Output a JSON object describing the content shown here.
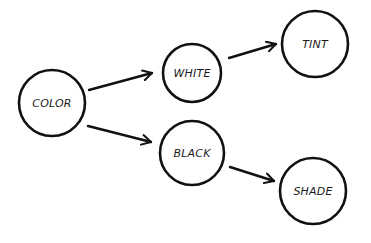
{
  "diagram": {
    "type": "concept-map",
    "colors": {
      "stroke": "#111111",
      "text": "#1a1a1a",
      "background": "#ffffff"
    },
    "nodes": [
      {
        "id": "color",
        "label": "COLOR",
        "cx": 52,
        "cy": 103,
        "r": 33
      },
      {
        "id": "white",
        "label": "WHITE",
        "cx": 192,
        "cy": 73,
        "r": 29
      },
      {
        "id": "tint",
        "label": "TINT",
        "cx": 315,
        "cy": 44,
        "r": 33
      },
      {
        "id": "black",
        "label": "BLACK",
        "cx": 192,
        "cy": 153,
        "r": 32
      },
      {
        "id": "shade",
        "label": "SHADE",
        "cx": 313,
        "cy": 191,
        "r": 33
      }
    ],
    "edges": [
      {
        "from": "color",
        "to": "white",
        "x1": 89,
        "y1": 90,
        "x2": 152,
        "y2": 73
      },
      {
        "from": "color",
        "to": "black",
        "x1": 88,
        "y1": 126,
        "x2": 151,
        "y2": 142
      },
      {
        "from": "white",
        "to": "tint",
        "x1": 229,
        "y1": 58,
        "x2": 276,
        "y2": 44
      },
      {
        "from": "black",
        "to": "shade",
        "x1": 230,
        "y1": 167,
        "x2": 274,
        "y2": 181
      }
    ]
  }
}
